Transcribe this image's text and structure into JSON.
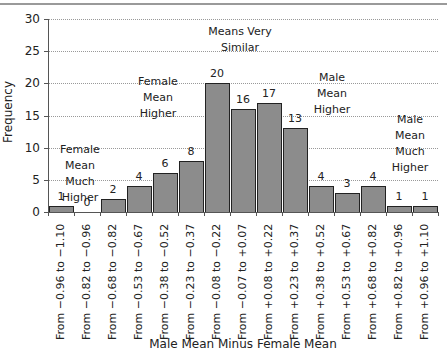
{
  "chart_data": {
    "type": "bar",
    "title": "",
    "xlabel": "Male Mean Minus Female Mean",
    "ylabel": "Frequency",
    "ylim": [
      0,
      30
    ],
    "yticks": [
      "0",
      "5",
      "10",
      "15",
      "20",
      "25",
      "30"
    ],
    "grid": true,
    "legend": null,
    "categories": [
      "From −0.96 to −1.10",
      "From −0.82 to −0.96",
      "From −0.68 to −0.82",
      "From −0.53 to −0.67",
      "From −0.38 to −0.52",
      "From −0.23 to −0.37",
      "From −0.08 to −0.22",
      "From −0.07 to +0.07",
      "From +0.08 to +0.22",
      "From +0.23 to +0.37",
      "From +0.38 to +0.52",
      "From +0.53 to +0.67",
      "From +0.68 to +0.82",
      "From +0.82 to +0.96",
      "From +0.96 to +1.10"
    ],
    "values": [
      1,
      0,
      2,
      4,
      6,
      8,
      20,
      16,
      17,
      13,
      4,
      3,
      4,
      1,
      1
    ],
    "value_labels": [
      "1",
      "0",
      "2",
      "4",
      "6",
      "8",
      "20",
      "16",
      "17",
      "13",
      "4",
      "3",
      "4",
      "1",
      "1"
    ],
    "annotations": [
      {
        "text": [
          "Female",
          "Mean",
          "Much",
          "Higher"
        ]
      },
      {
        "text": [
          "Female",
          "Mean",
          "Higher"
        ]
      },
      {
        "text": [
          "Means Very",
          "Similar"
        ]
      },
      {
        "text": [
          "Male",
          "Mean",
          "Higher"
        ]
      },
      {
        "text": [
          "Male",
          "Mean",
          "Much",
          "Higher"
        ]
      }
    ]
  }
}
